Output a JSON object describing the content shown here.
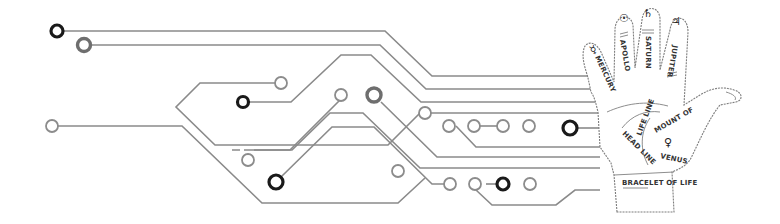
{
  "illustration": {
    "subject": "circuit-board traces leading into palmistry hand",
    "colors": {
      "background": "#ffffff",
      "trace": "#8a8a8a",
      "pad_dark": "#1a1a1a",
      "hand_outline": "#7d7d7d",
      "label_text": "#333333"
    }
  },
  "hand": {
    "fingers": [
      {
        "name": "MERCURY",
        "symbol": "☿"
      },
      {
        "name": "APOLLO",
        "symbol": "☉"
      },
      {
        "name": "SATURN",
        "symbol": "♄"
      },
      {
        "name": "JUPITER",
        "symbol": "♃"
      }
    ],
    "palm_labels": {
      "mount": "MOUNT OF",
      "venus": "VENUS",
      "venus_symbol": "♀",
      "life_line": "LIFE LINE",
      "head_line": "HEAD LINE",
      "bracelet": "BRACELET OF LIFE"
    }
  }
}
